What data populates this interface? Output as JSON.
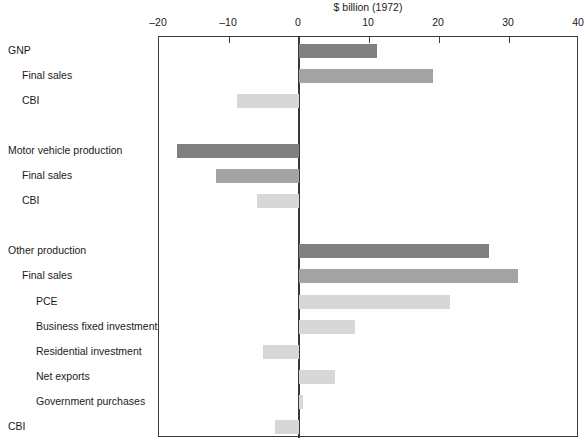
{
  "chart_data": {
    "type": "bar",
    "orientation": "horizontal",
    "title": "$ billion (1972)",
    "xlabel": "$ billion (1972)",
    "ylabel": "",
    "xlim": [
      -20,
      40
    ],
    "xticks": [
      -20,
      -10,
      0,
      10,
      20,
      30,
      40
    ],
    "xtick_labels": [
      "–20",
      "–10",
      "0",
      "10",
      "20",
      "30",
      "40"
    ],
    "grid": false,
    "legend": null,
    "zero_line": true,
    "categories": [
      "GNP",
      "Final sales",
      "CBI",
      "Motor vehicle production",
      "Final sales",
      "CBI",
      "Other production",
      "Final sales",
      "PCE",
      "Business fixed investment",
      "Residential investment",
      "Net exports",
      "Government purchases",
      "CBI"
    ],
    "values": [
      11.1,
      19.2,
      -8.8,
      -17.4,
      -11.9,
      -6.0,
      27.2,
      31.3,
      21.5,
      8.0,
      -5.2,
      5.1,
      0.6,
      -3.5
    ],
    "bars": [
      {
        "label": "GNP",
        "indent": 0,
        "value": 11.1,
        "shade": "dark",
        "row": 0
      },
      {
        "label": "Final sales",
        "indent": 1,
        "value": 19.2,
        "shade": "medium",
        "row": 1
      },
      {
        "label": "CBI",
        "indent": 1,
        "value": -8.8,
        "shade": "light",
        "row": 2
      },
      {
        "label": "Motor vehicle production",
        "indent": 0,
        "value": -17.4,
        "shade": "dark",
        "row": 4
      },
      {
        "label": "Final sales",
        "indent": 1,
        "value": -11.9,
        "shade": "medium",
        "row": 5
      },
      {
        "label": "CBI",
        "indent": 1,
        "value": -6.0,
        "shade": "light",
        "row": 6
      },
      {
        "label": "Other production",
        "indent": 0,
        "value": 27.2,
        "shade": "dark",
        "row": 8
      },
      {
        "label": "Final sales",
        "indent": 1,
        "value": 31.3,
        "shade": "medium",
        "row": 9
      },
      {
        "label": "PCE",
        "indent": 2,
        "value": 21.5,
        "shade": "light",
        "row": 10
      },
      {
        "label": "Business fixed investment",
        "indent": 2,
        "value": 8.0,
        "shade": "light",
        "row": 11
      },
      {
        "label": "Residential investment",
        "indent": 2,
        "value": -5.2,
        "shade": "light",
        "row": 12
      },
      {
        "label": "Net exports",
        "indent": 2,
        "value": 5.1,
        "shade": "light",
        "row": 13
      },
      {
        "label": "Government purchases",
        "indent": 2,
        "value": 0.6,
        "shade": "light",
        "row": 14
      },
      {
        "label": "CBI",
        "indent": 0,
        "value": -3.5,
        "shade": "light",
        "row": 15
      }
    ],
    "colors": {
      "dark": "#808080",
      "medium": "#a3a3a3",
      "light": "#d7d7d7",
      "axis": "#3a3a3a",
      "text": "#1a1a1a",
      "background": "#ffffff"
    }
  }
}
